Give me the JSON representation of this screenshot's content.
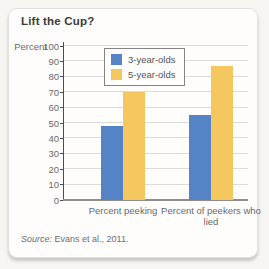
{
  "figure": {
    "title": "Lift the Cup?"
  },
  "source": {
    "prefix": "Source:",
    "text": "Evans et al., 2011."
  },
  "chart_data": {
    "type": "bar",
    "title": "Lift the Cup?",
    "xlabel": "",
    "ylabel": "Percent",
    "ylim": [
      0,
      100
    ],
    "yticks": [
      0,
      10,
      20,
      30,
      40,
      50,
      60,
      70,
      80,
      90,
      100
    ],
    "grid": true,
    "legend_position": "upper-left-inside",
    "categories": [
      "Percent peeking",
      "Percent of peekers who lied"
    ],
    "series": [
      {
        "name": "3-year-olds",
        "color": "#5584c6",
        "values": [
          48,
          55
        ]
      },
      {
        "name": "5-year-olds",
        "color": "#f4c75f",
        "values": [
          70,
          87
        ]
      }
    ],
    "source_note": "Source: Evans et al., 2011."
  },
  "colors": {
    "page_background": "#f6f5f2",
    "card_background": "#fefdfc",
    "card_border": "#e4e1dc",
    "gridline": "#dcdbd8",
    "axis": "#4d4d4d",
    "baseline": "#8e8d8b",
    "text_primary": "#3b3b3b",
    "text_secondary": "#6a6a6a",
    "series_blue": "#5584c6",
    "series_yellow": "#f4c75f"
  }
}
